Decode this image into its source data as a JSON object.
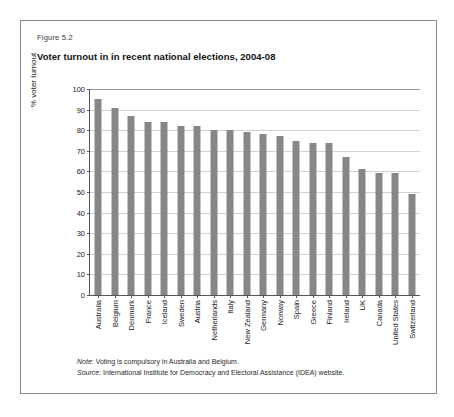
{
  "figure": {
    "number": "Figure 5.2",
    "title": "Voter turnout in in recent national elections, 2004-08"
  },
  "notes": {
    "note_label": "Note:",
    "note_text": "Voting is compulsory in Australia and Belgium.",
    "source_label": "Source:",
    "source_text": "International Institute for Democracy and Electoral Assistance (IDEA) website."
  },
  "colors": {
    "bar": "#878787",
    "gridline": "#d2d2d2",
    "axis": "#555555",
    "frame": "#8a8a8a"
  },
  "chart_data": {
    "type": "bar",
    "title": "Voter turnout in in recent national elections, 2004-08",
    "xlabel": "",
    "ylabel": "% voter turnout",
    "ylim": [
      0,
      100
    ],
    "ytick_step": 10,
    "yticks": [
      0,
      10,
      20,
      30,
      40,
      50,
      60,
      70,
      80,
      90,
      100
    ],
    "grid": true,
    "legend": null,
    "categories": [
      "Australia",
      "Belgium",
      "Denmark",
      "France",
      "Iceland",
      "Sweden",
      "Austria",
      "Netherlands",
      "Italy",
      "New Zealand",
      "Germany",
      "Norway",
      "Spain",
      "Greece",
      "Finland",
      "Ireland",
      "UK",
      "Canada",
      "United States",
      "Switzerland"
    ],
    "values": [
      95,
      91,
      87,
      84,
      84,
      82,
      82,
      80,
      80,
      79,
      78,
      77,
      75,
      74,
      74,
      67,
      61,
      59,
      59,
      49
    ]
  }
}
